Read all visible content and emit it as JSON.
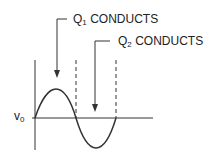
{
  "diagram": {
    "labels": {
      "q1": {
        "prefix": "Q",
        "sub": "1",
        "text": " CONDUCTS"
      },
      "q2": {
        "prefix": "Q",
        "sub": "2",
        "text": " CONDUCTS"
      },
      "axis": {
        "prefix": "v",
        "sub": "0"
      }
    },
    "colors": {
      "stroke": "#333333",
      "background": "#ffffff"
    }
  }
}
